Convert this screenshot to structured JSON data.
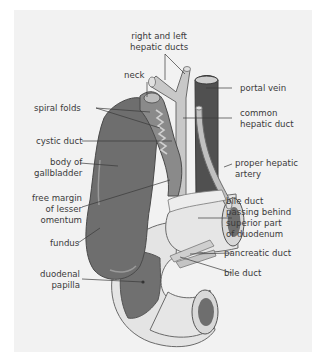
{
  "figure": {
    "type": "anatomical-diagram",
    "colors": {
      "background_panel": "#f2f2f2",
      "gallbladder": "#6e6e6e",
      "portal_vein": "#505050",
      "ducts": "#c8c8c8",
      "duodenum_wall": "#e4e4e4",
      "duodenum_interior": "#6a6a6a",
      "leader_lines": "#3a3a3a"
    },
    "labels": {
      "right_left_hepatic_ducts": [
        "right and left",
        "hepatic ducts"
      ],
      "neck": [
        "neck"
      ],
      "portal_vein": [
        "portal vein"
      ],
      "spiral_folds": [
        "spiral folds"
      ],
      "common_hepatic_duct": [
        "common",
        "hepatic duct"
      ],
      "cystic_duct": [
        "cystic duct"
      ],
      "body_of_gallbladder": [
        "body of",
        "gallbladder"
      ],
      "proper_hepatic_artery": [
        "proper hepatic",
        "artery"
      ],
      "free_margin_lesser_omentum": [
        "free margin",
        "of lesser",
        "omentum"
      ],
      "bile_duct_behind_duodenum": [
        "bile duct",
        "passing behind",
        "superior part",
        "of duodenum"
      ],
      "fundus": [
        "fundus"
      ],
      "pancreatic_duct": [
        "pancreatic duct"
      ],
      "bile_duct": [
        "bile duct"
      ],
      "duodenal_papilla": [
        "duodenal",
        "papilla"
      ]
    }
  }
}
